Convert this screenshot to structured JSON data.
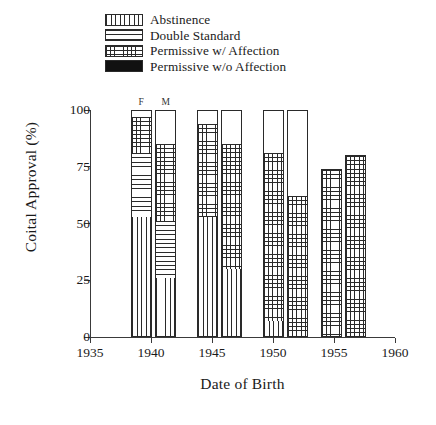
{
  "chart_data": {
    "type": "bar",
    "title": "",
    "subtitle": "",
    "xlabel": "Date of Birth",
    "ylabel": "Coital Approval (%)",
    "xlim": [
      1935,
      1960
    ],
    "ylim": [
      0,
      100
    ],
    "grid": false,
    "stacked": true,
    "legend_position": "top-center",
    "xticks": [
      "1935",
      "1940",
      "1945",
      "1950",
      "1955",
      "1960"
    ],
    "xtick_values": [
      1935,
      1940,
      1945,
      1950,
      1955,
      1960
    ],
    "yticks": [
      "0",
      "25",
      "50",
      "75",
      "100"
    ],
    "ytick_values": [
      0,
      25,
      50,
      75,
      100
    ],
    "series": [
      {
        "name": "Abstinence",
        "pattern": "vertical-lines",
        "values": [
          53,
          26,
          53,
          30,
          7,
          0,
          0,
          0
        ]
      },
      {
        "name": "Double Standard",
        "pattern": "horizontal-lines",
        "values": [
          28,
          25,
          0,
          0,
          0,
          0,
          0,
          0
        ]
      },
      {
        "name": "Permissive w/ Affection",
        "pattern": "crosshatch",
        "values": [
          16,
          34,
          41,
          55,
          74,
          62,
          74,
          80
        ]
      },
      {
        "name": "Permissive w/o Affection",
        "pattern": "solid-black",
        "values": [
          3,
          15,
          6,
          15,
          19,
          38,
          0,
          0
        ]
      }
    ],
    "bars": [
      {
        "id": "bar-1939-f",
        "group_label": "F",
        "year": 1939.2,
        "sex": "F",
        "segments": [
          {
            "series": "Abstinence",
            "from": 0,
            "to": 53
          },
          {
            "series": "Double Standard",
            "from": 53,
            "to": 81
          },
          {
            "series": "Permissive w/ Affection",
            "from": 81,
            "to": 97
          },
          {
            "series": "Permissive w/o Affection",
            "from": 97,
            "to": 100
          }
        ]
      },
      {
        "id": "bar-1939-m",
        "group_label": "M",
        "year": 1941.2,
        "sex": "M",
        "segments": [
          {
            "series": "Abstinence",
            "from": 0,
            "to": 26
          },
          {
            "series": "Double Standard",
            "from": 26,
            "to": 51
          },
          {
            "series": "Permissive w/ Affection",
            "from": 51,
            "to": 85
          },
          {
            "series": "Permissive w/o Affection",
            "from": 85,
            "to": 100
          }
        ]
      },
      {
        "id": "bar-1945-f",
        "group_label": "",
        "year": 1944.6,
        "sex": "F",
        "segments": [
          {
            "series": "Abstinence",
            "from": 0,
            "to": 53
          },
          {
            "series": "Permissive w/ Affection",
            "from": 53,
            "to": 94
          },
          {
            "series": "Permissive w/o Affection",
            "from": 94,
            "to": 100
          }
        ]
      },
      {
        "id": "bar-1945-m",
        "group_label": "",
        "year": 1946.6,
        "sex": "M",
        "segments": [
          {
            "series": "Abstinence",
            "from": 0,
            "to": 30
          },
          {
            "series": "Permissive w/ Affection",
            "from": 30,
            "to": 85
          },
          {
            "series": "Permissive w/o Affection",
            "from": 85,
            "to": 100
          }
        ]
      },
      {
        "id": "bar-1950-f",
        "group_label": "",
        "year": 1950.0,
        "sex": "F",
        "segments": [
          {
            "series": "Abstinence",
            "from": 0,
            "to": 7
          },
          {
            "series": "Permissive w/ Affection",
            "from": 7,
            "to": 81
          },
          {
            "series": "Permissive w/o Affection",
            "from": 81,
            "to": 100
          }
        ]
      },
      {
        "id": "bar-1950-m",
        "group_label": "",
        "year": 1952.0,
        "sex": "M",
        "segments": [
          {
            "series": "Permissive w/ Affection",
            "from": 0,
            "to": 62
          },
          {
            "series": "Permissive w/o Affection",
            "from": 62,
            "to": 100
          }
        ]
      },
      {
        "id": "bar-1955-f",
        "group_label": "",
        "year": 1954.8,
        "sex": "F",
        "segments": [
          {
            "series": "Permissive w/ Affection",
            "from": 0,
            "to": 74
          }
        ]
      },
      {
        "id": "bar-1955-m",
        "group_label": "",
        "year": 1956.8,
        "sex": "M",
        "segments": [
          {
            "series": "Permissive w/ Affection",
            "from": 0,
            "to": 80
          }
        ]
      }
    ]
  },
  "legend": {
    "items": [
      {
        "label": "Abstinence",
        "pattern": "vertical-lines"
      },
      {
        "label": "Double Standard",
        "pattern": "horizontal-lines"
      },
      {
        "label": "Permissive w/ Affection",
        "pattern": "crosshatch"
      },
      {
        "label": "Permissive w/o Affection",
        "pattern": "solid-black"
      }
    ]
  },
  "colors": {
    "ink": "#1a1a1a",
    "axis": "#3a3a3a",
    "solid_fill": "#111111",
    "background": "#ffffff"
  }
}
